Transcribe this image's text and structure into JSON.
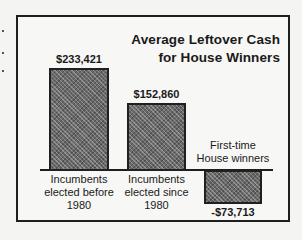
{
  "chart_data": {
    "type": "bar",
    "title": "Average Leftover Cash for House Winners",
    "title_lines": [
      "Average Leftover Cash",
      "for House Winners"
    ],
    "categories": [
      "Incumbents elected before 1980",
      "Incumbents elected since 1980",
      "First-time House winners"
    ],
    "category_lines": [
      [
        "Incumbents",
        "elected before",
        "1980"
      ],
      [
        "Incumbents",
        "elected since",
        "1980"
      ],
      [
        "First-time",
        "House winners"
      ]
    ],
    "values": [
      233421,
      152860,
      -73713
    ],
    "value_labels": [
      "$233,421",
      "$152,860",
      "-$73,713"
    ],
    "xlabel": "",
    "ylabel": "",
    "ylim": [
      -80000,
      240000
    ],
    "grid": false,
    "legend": "none",
    "colors": {
      "bar_fill": "#6a6a6a",
      "border": "#1e1e1e",
      "background": "#f7f7f5"
    }
  }
}
